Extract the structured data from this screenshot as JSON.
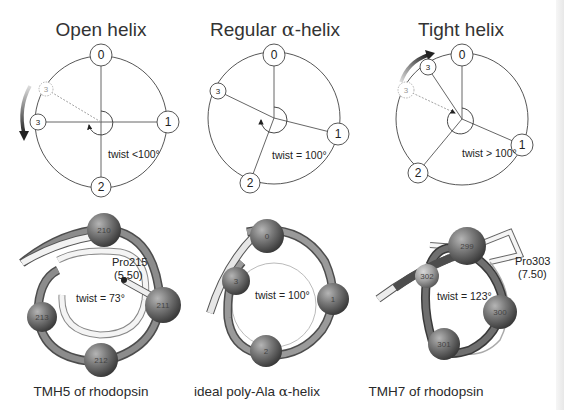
{
  "figure": {
    "panels": [
      {
        "id": "open",
        "title": "Open helix",
        "twist_label": "twist <100°",
        "nodes": [
          "0",
          "1",
          "2",
          "3"
        ],
        "ghost_node": "3",
        "rotation_arrow": "counter-clockwise",
        "model": {
          "caption": "TMH5 of rhodopsin",
          "twist_label": "twist = 73°",
          "residues": [
            "210",
            "211",
            "212",
            "213"
          ],
          "annotation_line1": "Pro215",
          "annotation_line2": "(5.50)"
        }
      },
      {
        "id": "regular",
        "title_prefix": "Regular ",
        "title_greek": "α",
        "title_suffix": "-helix",
        "twist_label": "twist = 100°",
        "nodes": [
          "0",
          "1",
          "2",
          "3"
        ],
        "model": {
          "caption_prefix": "ideal poly-Ala ",
          "caption_greek": "α",
          "caption_suffix": "-helix",
          "twist_label": "twist = 100°",
          "residues": [
            "0",
            "1",
            "2",
            "3"
          ]
        }
      },
      {
        "id": "tight",
        "title": "Tight helix",
        "twist_label": "twist > 100°",
        "nodes": [
          "0",
          "1",
          "2",
          "3"
        ],
        "ghost_node": "3",
        "rotation_arrow": "clockwise",
        "model": {
          "caption": "TMH7 of rhodopsin",
          "twist_label": "twist = 123°",
          "residues": [
            "299",
            "300",
            "301",
            "302"
          ],
          "annotation_line1": "Pro303",
          "annotation_line2": "(7.50)"
        }
      }
    ]
  },
  "colors": {
    "line": "#444444",
    "ghost": "#9a9a9a",
    "tube": "#8a8a8a",
    "sphere": "#6e6e6e"
  }
}
